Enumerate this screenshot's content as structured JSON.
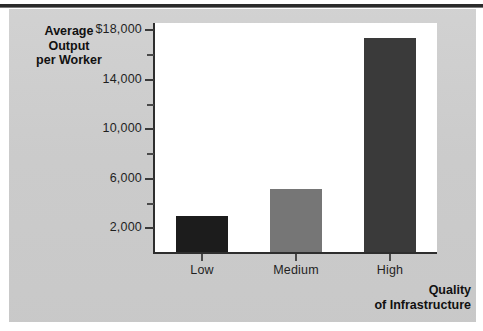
{
  "chart_data": {
    "type": "bar",
    "title": "",
    "subtitle": "",
    "xlabel": "Quality of Infrastructure",
    "xlabel_line1": "Quality",
    "xlabel_line2": "of Infrastructure",
    "ylabel": "Average Output per Worker",
    "ylabel_line1": "Average",
    "ylabel_line2": "Output",
    "ylabel_line3": "per Worker",
    "categories": [
      "Low",
      "Medium",
      "High"
    ],
    "values": [
      3000,
      5200,
      17400
    ],
    "ylim": [
      0,
      18600
    ],
    "ytick_values": [
      2000,
      4000,
      6000,
      8000,
      10000,
      12000,
      14000,
      16000,
      18000
    ],
    "ytick_labels": [
      "2,000",
      "",
      "6,000",
      "",
      "10,000",
      "",
      "14,000",
      "",
      "$18,000"
    ],
    "ytick_major": [
      2000,
      6000,
      10000,
      14000,
      18000
    ],
    "ytick_minor": [
      4000,
      8000,
      12000,
      16000
    ],
    "grid": false,
    "legend": false,
    "bar_colors": [
      "#1c1c1c",
      "#767676",
      "#3a3a3a"
    ],
    "plot_background": "#ffffff",
    "figure_background": "#cdcdcd",
    "axis_color": "#2e2e2e",
    "text_color": "#1f1f1f"
  },
  "y_ticks": [
    {
      "label": "$18,000",
      "value": 18000,
      "major": true
    },
    {
      "label": "",
      "value": 16000,
      "major": false
    },
    {
      "label": "14,000",
      "value": 14000,
      "major": true
    },
    {
      "label": "",
      "value": 12000,
      "major": false
    },
    {
      "label": "10,000",
      "value": 10000,
      "major": true
    },
    {
      "label": "",
      "value": 8000,
      "major": false
    },
    {
      "label": "6,000",
      "value": 6000,
      "major": true
    },
    {
      "label": "",
      "value": 4000,
      "major": false
    },
    {
      "label": "2,000",
      "value": 2000,
      "major": true
    }
  ],
  "bars": [
    {
      "label": "Low",
      "value": 3000,
      "color": "#1c1c1c"
    },
    {
      "label": "Medium",
      "value": 5200,
      "color": "#767676"
    },
    {
      "label": "High",
      "value": 17400,
      "color": "#3a3a3a"
    }
  ]
}
